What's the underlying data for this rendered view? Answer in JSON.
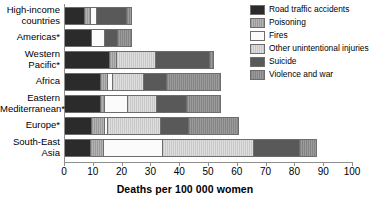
{
  "chart_data": {
    "type": "bar",
    "orientation": "horizontal",
    "stacked": true,
    "title": "",
    "xlabel": "Deaths per 100 000 women",
    "ylabel": "",
    "xlim": [
      0,
      100
    ],
    "xticks": [
      0,
      10,
      20,
      30,
      40,
      50,
      60,
      70,
      80,
      90,
      100
    ],
    "xticklabels": [
      "0",
      "10",
      "20",
      "30",
      "40",
      "50",
      "60",
      "70",
      "80",
      "90",
      "100"
    ],
    "grid": false,
    "legend_position": "top-right",
    "categories": [
      "High-income countries",
      "Americas*",
      "Western Pacific*",
      "Africa",
      "Eastern Mediterranean*",
      "Europe*",
      "South-East Asia"
    ],
    "series": [
      {
        "name": "Road traffic accidents",
        "color": "#2b2b2b",
        "pattern": "solid-dark",
        "values": [
          7.0,
          9.5,
          15.5,
          12.5,
          12.5,
          9.5,
          9.0
        ]
      },
      {
        "name": "Poisoning",
        "color": "#a7a7a7",
        "pattern": "fine-vertical-hatch",
        "values": [
          2.0,
          0.0,
          2.5,
          2.5,
          1.5,
          4.5,
          4.5
        ]
      },
      {
        "name": "Fires",
        "color": "#fbfbfb",
        "pattern": "white",
        "values": [
          2.0,
          4.5,
          0.0,
          1.5,
          8.0,
          1.0,
          20.5
        ]
      },
      {
        "name": "Other unintentional injuries",
        "color": "#d4d4d4",
        "pattern": "light-vertical-hatch",
        "values": [
          0.0,
          0.0,
          13.5,
          11.0,
          10.0,
          18.5,
          31.5
        ]
      },
      {
        "name": "Suicide",
        "color": "#595959",
        "pattern": "solid-mid",
        "values": [
          10.5,
          4.5,
          19.0,
          8.0,
          10.5,
          9.5,
          16.0
        ]
      },
      {
        "name": "Violence and war",
        "color": "#909090",
        "pattern": "mid-vertical-hatch",
        "values": [
          1.5,
          4.5,
          1.0,
          18.5,
          11.5,
          17.0,
          5.5
        ]
      }
    ],
    "totals": [
      23.0,
      23.0,
      51.5,
      54.0,
      54.0,
      60.0,
      87.0
    ]
  },
  "legend": {
    "items": [
      {
        "label": "Road traffic accidents",
        "swatch": "legend-swatch-road-traffic-accidents"
      },
      {
        "label": "Poisoning",
        "swatch": "legend-swatch-poisoning"
      },
      {
        "label": "Fires",
        "swatch": "legend-swatch-fires"
      },
      {
        "label": "Other unintentional injuries",
        "swatch": "legend-swatch-other-unintentional-injuries"
      },
      {
        "label": "Suicide",
        "swatch": "legend-swatch-suicide"
      },
      {
        "label": "Violence and war",
        "swatch": "legend-swatch-violence-and-war"
      }
    ]
  }
}
